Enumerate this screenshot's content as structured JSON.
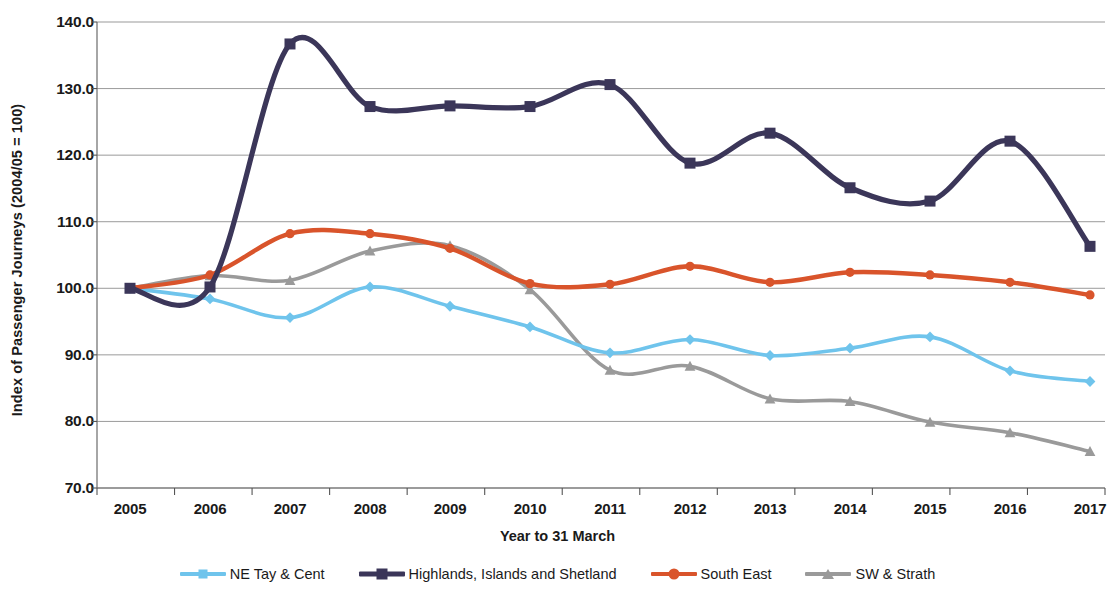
{
  "chart_data": {
    "type": "line",
    "title": "",
    "xlabel": "Year to 31 March",
    "ylabel": "Index of Passenger Journeys (2004/05 = 100)",
    "categories": [
      "2005",
      "2006",
      "2007",
      "2008",
      "2009",
      "2010",
      "2011",
      "2012",
      "2013",
      "2014",
      "2015",
      "2016",
      "2017"
    ],
    "x": [
      2005,
      2006,
      2007,
      2008,
      2009,
      2010,
      2011,
      2012,
      2013,
      2014,
      2015,
      2016,
      2017
    ],
    "ylim": [
      70.0,
      140.0
    ],
    "xlim": [
      2005,
      2017
    ],
    "yticks": [
      "70.0",
      "80.0",
      "90.0",
      "100.0",
      "110.0",
      "120.0",
      "130.0",
      "140.0"
    ],
    "ytick_values": [
      70.0,
      80.0,
      90.0,
      100.0,
      110.0,
      120.0,
      130.0,
      140.0
    ],
    "grid": true,
    "smoothing": true,
    "legend_position": "bottom",
    "series": [
      {
        "name": "NE Tay & Cent",
        "color": "#6FC4EC",
        "marker": "diamond",
        "values": [
          100.0,
          98.4,
          95.6,
          100.2,
          97.3,
          94.2,
          90.3,
          92.3,
          89.9,
          91.0,
          92.7,
          87.6,
          86.0
        ]
      },
      {
        "name": "Highlands, Islands and Shetland",
        "color": "#3B3659",
        "marker": "square",
        "values": [
          100.0,
          100.2,
          136.7,
          127.3,
          127.4,
          127.3,
          130.6,
          118.8,
          123.3,
          115.1,
          113.1,
          122.1,
          106.3
        ]
      },
      {
        "name": "South East",
        "color": "#D9542B",
        "marker": "circle",
        "values": [
          100.0,
          102.0,
          108.2,
          108.2,
          106.0,
          100.7,
          100.6,
          103.3,
          100.9,
          102.4,
          102.0,
          100.9,
          99.0
        ]
      },
      {
        "name": "SW & Strath",
        "color": "#9A9A9A",
        "marker": "triangle",
        "values": [
          100.0,
          101.9,
          101.2,
          105.6,
          106.4,
          99.8,
          87.7,
          88.3,
          83.4,
          83.0,
          79.9,
          78.3,
          75.5
        ]
      }
    ]
  },
  "axis": {
    "y_title": "Index of Passenger Journeys (2004/05 = 100)",
    "x_title": "Year to 31 March"
  },
  "legend": {
    "items": [
      {
        "label": "NE Tay & Cent"
      },
      {
        "label": "Highlands, Islands and Shetland"
      },
      {
        "label": "South East"
      },
      {
        "label": "SW & Strath"
      }
    ]
  }
}
